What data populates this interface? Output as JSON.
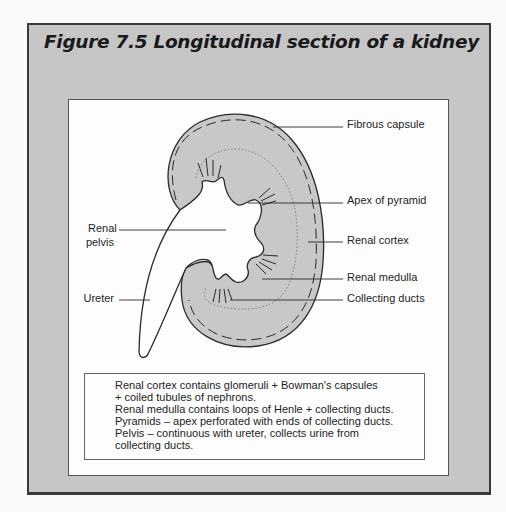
{
  "figure": {
    "title": "Figure 7.5 Longitudinal section of a kidney",
    "colors": {
      "frame_background": "#c6c6c6",
      "frame_border": "#3a3a3a",
      "panel_background": "#fdfdfd",
      "kidney_fill": "#c8c8c8",
      "outline": "#2a2a2a"
    }
  },
  "diagram": {
    "labels": {
      "fibrous_capsule": "Fibrous capsule",
      "apex_of_pyramid": "Apex of pyramid",
      "renal_cortex": "Renal cortex",
      "renal_medulla": "Renal medulla",
      "collecting_ducts": "Collecting ducts",
      "renal_pelvis_line1": "Renal",
      "renal_pelvis_line2": "pelvis",
      "ureter": "Ureter"
    }
  },
  "notes": {
    "lines": [
      "Renal cortex contains glomeruli + Bowman's capsules",
      "+ coiled tubules of nephrons.",
      "Renal medulla contains loops of Henle + collecting ducts.",
      "Pyramids – apex perforated with ends of collecting ducts.",
      "Pelvis – continuous with ureter, collects urine from",
      "collecting ducts."
    ]
  }
}
